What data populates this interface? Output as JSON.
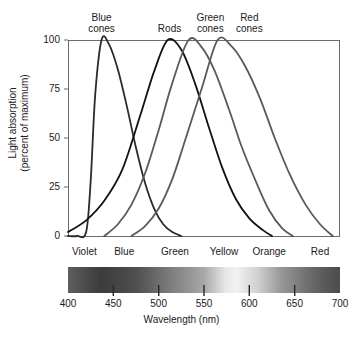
{
  "chart_data": {
    "type": "line",
    "title": "",
    "xlabel": "Wavelength (nm)",
    "ylabel_line1": "Light absorption",
    "ylabel_line2": "(percent of maximum)",
    "xlim": [
      400,
      700
    ],
    "ylim": [
      0,
      100
    ],
    "xticks": [
      400,
      450,
      500,
      550,
      600,
      650,
      700
    ],
    "yticks": [
      0,
      25,
      50,
      75,
      100
    ],
    "grid": false,
    "legend_position": "above-plot-inline",
    "series": [
      {
        "name": "Blue cones",
        "color": "#2b2b2b",
        "peak_nm": 437,
        "peak_value": 100,
        "x": [
          400,
          410,
          420,
          425,
          430,
          437,
          445,
          455,
          465,
          475,
          485,
          495,
          505,
          515,
          525
        ],
        "values": [
          0,
          0,
          2,
          28,
          72,
          100,
          98,
          85,
          66,
          45,
          27,
          14,
          6,
          2,
          0
        ]
      },
      {
        "name": "Rods",
        "color": "#111111",
        "peak_nm": 510,
        "peak_value": 100,
        "x": [
          400,
          420,
          440,
          460,
          480,
          495,
          510,
          525,
          540,
          555,
          570,
          585,
          600,
          615,
          625
        ],
        "values": [
          2,
          8,
          18,
          34,
          62,
          84,
          100,
          95,
          78,
          56,
          35,
          19,
          9,
          3,
          0
        ]
      },
      {
        "name": "Green cones",
        "color": "#5a5a5a",
        "peak_nm": 533,
        "peak_value": 100,
        "x": [
          440,
          455,
          470,
          485,
          500,
          515,
          533,
          548,
          562,
          578,
          592,
          608,
          622,
          636,
          648
        ],
        "values": [
          0,
          6,
          16,
          32,
          54,
          78,
          100,
          96,
          84,
          64,
          45,
          27,
          13,
          4,
          0
        ]
      },
      {
        "name": "Red cones",
        "color": "#5a5a5a",
        "peak_nm": 565,
        "peak_value": 100,
        "x": [
          470,
          485,
          500,
          515,
          530,
          548,
          565,
          580,
          595,
          612,
          628,
          645,
          662,
          678,
          692
        ],
        "values": [
          0,
          5,
          14,
          29,
          50,
          76,
          100,
          97,
          87,
          70,
          50,
          31,
          16,
          6,
          0
        ]
      }
    ],
    "spectrum_bands": [
      {
        "label": "Violet",
        "center_nm": 418
      },
      {
        "label": "Blue",
        "center_nm": 462
      },
      {
        "label": "Green",
        "center_nm": 518
      },
      {
        "label": "Yellow",
        "center_nm": 572
      },
      {
        "label": "Orange",
        "center_nm": 622
      },
      {
        "label": "Red",
        "center_nm": 678
      }
    ],
    "curve_labels": [
      {
        "text": "Blue\ncones",
        "center_nm": 437
      },
      {
        "text": "Rods",
        "center_nm": 512
      },
      {
        "text": "Green\ncones",
        "center_nm": 557
      },
      {
        "text": "Red\ncones",
        "center_nm": 600
      }
    ]
  }
}
